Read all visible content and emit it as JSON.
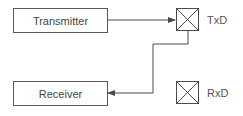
{
  "diagram": {
    "blocks": [
      {
        "id": "transmitter",
        "label": "Transmitter"
      },
      {
        "id": "receiver",
        "label": "Receiver"
      }
    ],
    "pins": [
      {
        "id": "txd",
        "label": "TxD",
        "icon": "crossed-box-icon"
      },
      {
        "id": "rxd",
        "label": "RxD",
        "icon": "crossed-box-icon"
      }
    ],
    "connections": [
      {
        "from": "Transmitter",
        "to": "TxD",
        "style": "arrow"
      },
      {
        "from": "TxD",
        "to": "Receiver",
        "style": "arrow"
      }
    ],
    "colors": {
      "line": "#4a4a4a",
      "border": "#5a5a5a",
      "text": "#444444"
    }
  }
}
